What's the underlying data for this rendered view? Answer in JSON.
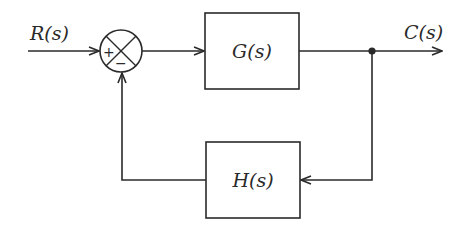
{
  "diagram": {
    "type": "negative feedback control block diagram",
    "input": {
      "label": "R(s)"
    },
    "output": {
      "label": "C(s)"
    },
    "summing_junction": {
      "plus_sign": "+",
      "minus_sign": "−"
    },
    "forward_block": {
      "label": "G(s)"
    },
    "feedback_block": {
      "label": "H(s)"
    },
    "colors": {
      "stroke": "#2a2a2a",
      "background": "#ffffff"
    }
  }
}
